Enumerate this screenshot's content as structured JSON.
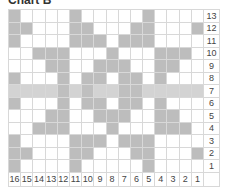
{
  "title": "Chart B",
  "chart_data": {
    "type": "heatmap",
    "title": "Chart B",
    "columns": 16,
    "rows": 13,
    "column_labels": [
      "16",
      "15",
      "14",
      "13",
      "12",
      "11",
      "10",
      "9",
      "8",
      "7",
      "6",
      "5",
      "4",
      "3",
      "2",
      "1"
    ],
    "row_labels": [
      "13",
      "12",
      "11",
      "10",
      "9",
      "8",
      "7",
      "6",
      "5",
      "4",
      "3",
      "2",
      "1"
    ],
    "highlight_row": "7",
    "filled_cells_by_row": {
      "13": [
        1,
        6,
        12
      ],
      "12": [
        1,
        2,
        6,
        7,
        11,
        12,
        16
      ],
      "11": [
        1,
        6,
        7,
        8,
        10,
        11,
        12
      ],
      "10": [
        3,
        4,
        5,
        9,
        13,
        14,
        15
      ],
      "9": [
        4,
        5,
        8,
        9,
        10,
        13,
        14
      ],
      "8": [
        1,
        5,
        7,
        8,
        10,
        11,
        13
      ],
      "7": [
        5,
        7,
        10,
        11
      ],
      "6": [
        1,
        5,
        7,
        8,
        10,
        11,
        13
      ],
      "5": [
        4,
        5,
        8,
        9,
        10,
        13,
        14
      ],
      "4": [
        3,
        4,
        5,
        9,
        13,
        14,
        15
      ],
      "3": [
        1,
        6,
        7,
        8,
        10,
        11,
        12
      ],
      "2": [
        1,
        2,
        6,
        7,
        11,
        12,
        16
      ],
      "1": [
        1,
        6,
        12
      ]
    },
    "note": "Filled cell indices are 1-based positions from the left (leftmost column labeled 16).",
    "colors": {
      "filled": "#bdbdbd",
      "highlight_row": "#d3d3d3",
      "grid": "#d8d8d8"
    }
  }
}
